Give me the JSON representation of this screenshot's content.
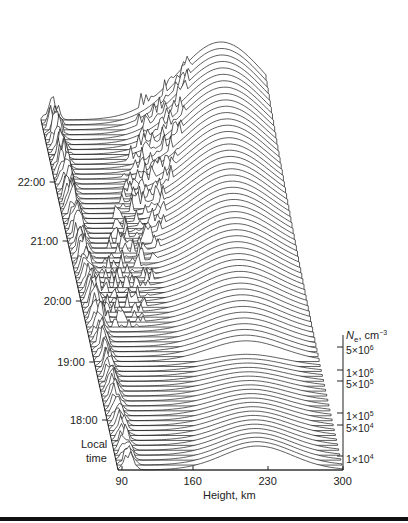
{
  "chart_data": {
    "type": "waterfall-3d",
    "title": "",
    "xlabel": "Height, km",
    "ylabel": "Local time",
    "zlabel": "Ne, cm-3",
    "x_ticks": [
      "90",
      "160",
      "230",
      "300"
    ],
    "x_range": [
      90,
      300
    ],
    "time_ticks": [
      "18:00",
      "19:00",
      "20:00",
      "21:00",
      "22:00"
    ],
    "time_range": [
      "~17:30",
      "~23:00"
    ],
    "z_ticks": [
      "5×10^6",
      "1×10^6",
      "5×10^5",
      "1×10^5",
      "5×10^4",
      "1×10^4"
    ],
    "z_scale": "log",
    "features": [
      {
        "name": "E-region spikes",
        "height_km": [
          90,
          110
        ],
        "time": "18:00-23:00"
      },
      {
        "name": "F-region peak",
        "height_km": [
          220,
          280
        ],
        "time": "17:30-23:00",
        "trend": "peak height increases toward 23:00"
      },
      {
        "name": "Spread irregularities",
        "height_km": [
          130,
          240
        ],
        "time": "20:00-23:00"
      }
    ]
  },
  "labels": {
    "xlabel": "Height, km",
    "ylabel_line1": "Local",
    "ylabel_line2": "time",
    "zlabel_prefix": "N",
    "zlabel_sub": "e",
    "zlabel_units": ", cm",
    "zlabel_exp": "−3"
  },
  "x_ticks": [
    {
      "label": "90",
      "x": 122
    },
    {
      "label": "160",
      "x": 193
    },
    {
      "label": "230",
      "x": 268
    },
    {
      "label": "300",
      "x": 343
    }
  ],
  "time_ticks": [
    {
      "label": "22:00",
      "y": 182
    },
    {
      "label": "21:00",
      "y": 241
    },
    {
      "label": "20:00",
      "y": 301
    },
    {
      "label": "19:00",
      "y": 362
    },
    {
      "label": "18:00",
      "y": 420
    }
  ],
  "z_ticks": [
    {
      "mant": "5×10",
      "exp": "6",
      "y": 347
    },
    {
      "mant": "1×10",
      "exp": "6",
      "y": 370
    },
    {
      "mant": "5×10",
      "exp": "5",
      "y": 381
    },
    {
      "mant": "1×10",
      "exp": "5",
      "y": 413
    },
    {
      "mant": "5×10",
      "exp": "4",
      "y": 425
    },
    {
      "mant": "1×10",
      "exp": "4",
      "y": 456
    }
  ]
}
